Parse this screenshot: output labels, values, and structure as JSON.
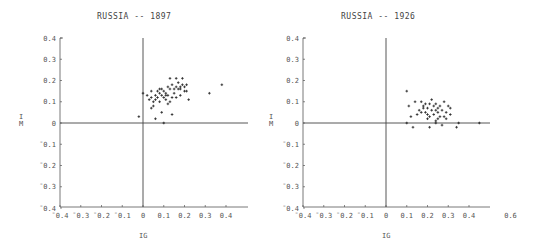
{
  "chart_data": [
    {
      "type": "scatter",
      "title": "RUSSIA -- 1897",
      "xlabel": "IG",
      "ylabel": "IM",
      "xlim": [
        -0.4,
        0.5
      ],
      "ylim": [
        -0.4,
        0.4
      ],
      "xticks": [
        "¯0.4",
        "¯0.3",
        "¯0.2",
        "¯0.1",
        "0",
        "0.1",
        "0.2",
        "0.3",
        "0.4"
      ],
      "yticks": [
        "0.4",
        "0.3",
        "0.2",
        "0.1",
        "0",
        "¯0.1",
        "¯0.2",
        "¯0.3",
        "¯0.4"
      ],
      "grid": false,
      "points": [
        [
          -0.02,
          0.03
        ],
        [
          0.0,
          0.14
        ],
        [
          0.02,
          0.13
        ],
        [
          0.03,
          0.11
        ],
        [
          0.04,
          0.15
        ],
        [
          0.04,
          0.12
        ],
        [
          0.05,
          0.1
        ],
        [
          0.05,
          0.08
        ],
        [
          0.06,
          0.13
        ],
        [
          0.06,
          0.11
        ],
        [
          0.07,
          0.15
        ],
        [
          0.07,
          0.12
        ],
        [
          0.08,
          0.14
        ],
        [
          0.08,
          0.1
        ],
        [
          0.09,
          0.13
        ],
        [
          0.09,
          0.16
        ],
        [
          0.1,
          0.12
        ],
        [
          0.1,
          0.15
        ],
        [
          0.11,
          0.14
        ],
        [
          0.11,
          0.11
        ],
        [
          0.12,
          0.17
        ],
        [
          0.12,
          0.13
        ],
        [
          0.13,
          0.21
        ],
        [
          0.13,
          0.16
        ],
        [
          0.14,
          0.18
        ],
        [
          0.14,
          0.12
        ],
        [
          0.15,
          0.16
        ],
        [
          0.15,
          0.14
        ],
        [
          0.16,
          0.21
        ],
        [
          0.16,
          0.17
        ],
        [
          0.17,
          0.19
        ],
        [
          0.17,
          0.16
        ],
        [
          0.18,
          0.17
        ],
        [
          0.18,
          0.13
        ],
        [
          0.19,
          0.21
        ],
        [
          0.19,
          0.18
        ],
        [
          0.2,
          0.17
        ],
        [
          0.2,
          0.15
        ],
        [
          0.21,
          0.18
        ],
        [
          0.22,
          0.11
        ],
        [
          0.06,
          0.02
        ],
        [
          0.09,
          0.05
        ],
        [
          0.1,
          0.0
        ],
        [
          0.14,
          0.04
        ],
        [
          0.04,
          0.07
        ],
        [
          0.12,
          0.09
        ],
        [
          0.32,
          0.14
        ],
        [
          0.38,
          0.18
        ],
        [
          0.08,
          0.16
        ],
        [
          0.11,
          0.13
        ],
        [
          0.13,
          0.1
        ],
        [
          0.16,
          0.12
        ],
        [
          0.18,
          0.16
        ],
        [
          0.21,
          0.15
        ]
      ]
    },
    {
      "type": "scatter",
      "title": "RUSSIA -- 1926",
      "xlabel": "IG",
      "ylabel": "IM",
      "xlim": [
        -0.4,
        0.5
      ],
      "ylim": [
        -0.4,
        0.4
      ],
      "xticks": [
        "¯0.4",
        "¯0.3",
        "¯0.2",
        "¯0.1",
        "0",
        "0.1",
        "0.2",
        "0.3",
        "0.4",
        "0.6"
      ],
      "yticks": [
        "0.4",
        "0.3",
        "0.2",
        "0.1",
        "0",
        "¯0.1",
        "¯0.2",
        "¯0.3",
        "¯0.4"
      ],
      "grid": false,
      "points": [
        [
          0.1,
          0.15
        ],
        [
          0.11,
          0.08
        ],
        [
          0.12,
          0.03
        ],
        [
          0.14,
          0.1
        ],
        [
          0.15,
          0.04
        ],
        [
          0.16,
          0.06
        ],
        [
          0.17,
          0.1
        ],
        [
          0.18,
          0.08
        ],
        [
          0.19,
          0.05
        ],
        [
          0.19,
          0.09
        ],
        [
          0.2,
          0.07
        ],
        [
          0.2,
          0.04
        ],
        [
          0.21,
          0.03
        ],
        [
          0.21,
          0.09
        ],
        [
          0.22,
          0.06
        ],
        [
          0.22,
          0.11
        ],
        [
          0.23,
          0.08
        ],
        [
          0.23,
          0.04
        ],
        [
          0.24,
          0.06
        ],
        [
          0.24,
          0.09
        ],
        [
          0.25,
          0.07
        ],
        [
          0.25,
          0.05
        ],
        [
          0.26,
          0.08
        ],
        [
          0.26,
          0.03
        ],
        [
          0.27,
          0.06
        ],
        [
          0.28,
          0.1
        ],
        [
          0.29,
          0.05
        ],
        [
          0.3,
          0.08
        ],
        [
          0.31,
          0.04
        ],
        [
          0.31,
          0.07
        ],
        [
          0.1,
          0.0
        ],
        [
          0.13,
          -0.02
        ],
        [
          0.21,
          -0.02
        ],
        [
          0.24,
          0.0
        ],
        [
          0.24,
          0.01
        ],
        [
          0.27,
          -0.01
        ],
        [
          0.34,
          -0.02
        ],
        [
          0.35,
          0.0
        ],
        [
          0.45,
          0.0
        ],
        [
          0.18,
          0.07
        ],
        [
          0.2,
          0.02
        ],
        [
          0.25,
          0.02
        ],
        [
          0.28,
          0.03
        ],
        [
          0.29,
          0.02
        ],
        [
          0.17,
          0.05
        ]
      ]
    }
  ],
  "panels": [
    {
      "title": "RUSSIA -- 1897",
      "xlabel": "IG",
      "ylabel_top": "I",
      "ylabel_bottom": "M"
    },
    {
      "title": "RUSSIA -- 1926",
      "xlabel": "IG",
      "ylabel_top": "I",
      "ylabel_bottom": "M"
    }
  ]
}
